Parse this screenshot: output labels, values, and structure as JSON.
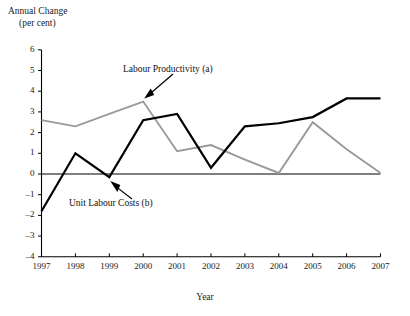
{
  "chart_data": {
    "type": "line",
    "title": "",
    "ylabel": "Annual Change\n(per cent)",
    "ylabel_line1": "Annual Change",
    "ylabel_line2": "(per cent)",
    "xlabel": "Year",
    "categories": [
      "1997",
      "1998",
      "1999",
      "2000",
      "2001",
      "2002",
      "2003",
      "2004",
      "2005",
      "2006",
      "2007"
    ],
    "x": [
      1997,
      1998,
      1999,
      2000,
      2001,
      2002,
      2003,
      2004,
      2005,
      2006,
      2007
    ],
    "ylim": [
      -4,
      6
    ],
    "xlim": [
      1997,
      2007
    ],
    "yticks": [
      6,
      5,
      4,
      3,
      2,
      1,
      0,
      -1,
      -2,
      -3,
      -4
    ],
    "ytick_labels": [
      "6",
      "5",
      "4",
      "3",
      "2",
      "1",
      "0",
      "–1",
      "–2",
      "–3",
      "–4"
    ],
    "grid": false,
    "legend_position": "inline-annotations",
    "series": [
      {
        "name": "Labour Productivity (a)",
        "color": "#9a9a9a",
        "values": [
          2.6,
          2.3,
          2.9,
          3.5,
          1.1,
          1.4,
          0.7,
          0.05,
          2.5,
          1.2,
          0.05
        ]
      },
      {
        "name": "Unit Labour Costs (b)",
        "color": "#000000",
        "values": [
          -1.8,
          1.0,
          -0.15,
          2.6,
          2.9,
          0.3,
          2.3,
          2.45,
          2.75,
          3.65,
          3.65
        ]
      }
    ],
    "annotations": [
      {
        "text": "Labour Productivity (a)",
        "target_x": 2000,
        "target_y": 3.5
      },
      {
        "text": "Unit Labour Costs (b)",
        "target_x": 1999,
        "target_y": -0.15
      }
    ]
  }
}
